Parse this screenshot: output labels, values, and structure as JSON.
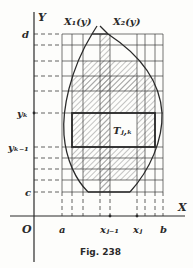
{
  "figure": {
    "caption": "Fig. 238",
    "axes": {
      "x_label": "X",
      "y_label": "Y",
      "origin_label": "O"
    },
    "curves": [
      {
        "name": "left_boundary",
        "label": "X₁(y)"
      },
      {
        "name": "right_boundary",
        "label": "X₂(y)"
      }
    ],
    "x_ticks": [
      {
        "label": "a",
        "x": 62
      },
      {
        "label": "xⱼ₋₁",
        "x": 110
      },
      {
        "label": "xⱼ",
        "x": 137
      },
      {
        "label": "b",
        "x": 163
      }
    ],
    "y_ticks": [
      {
        "label": "d",
        "y": 34
      },
      {
        "label": "yₖ",
        "y": 113
      },
      {
        "label": "yₖ₋₁",
        "y": 147
      },
      {
        "label": "c",
        "y": 192
      }
    ],
    "cell_label": "Tⱼ,ₖ",
    "grid": {
      "columns": [
        62,
        72,
        83,
        100,
        110,
        137,
        145,
        155,
        163
      ],
      "rows": [
        34,
        45,
        61,
        76,
        91,
        113,
        147,
        158,
        169,
        180,
        192
      ]
    },
    "colors": {
      "ink": "#2a2a2a",
      "paper": "#fdfdfb",
      "hatch": "#8a8a8a"
    }
  }
}
